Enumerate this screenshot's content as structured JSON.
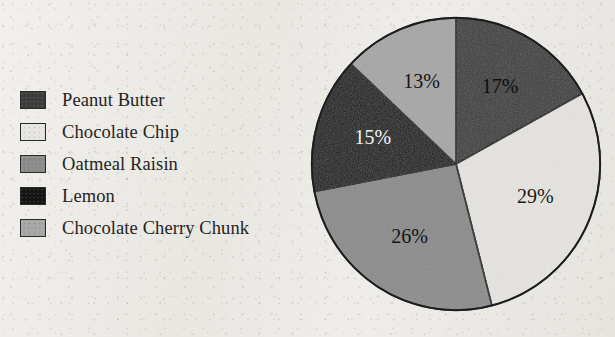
{
  "figure": {
    "type": "pie-chart",
    "background_color": "#eceae6"
  },
  "legend": {
    "items": [
      {
        "label": "Peanut Butter",
        "color": "#3c3c3c",
        "swatch_name": "legend-swatch-peanut-butter"
      },
      {
        "label": "Chocolate Chip",
        "color": "#e6e4e0",
        "swatch_name": "legend-swatch-chocolate-chip"
      },
      {
        "label": "Oatmeal Raisin",
        "color": "#8b8b8b",
        "swatch_name": "legend-swatch-oatmeal-raisin"
      },
      {
        "label": "Lemon",
        "color": "#151515",
        "swatch_name": "legend-swatch-lemon"
      },
      {
        "label": "Chocolate Cherry Chunk",
        "color": "#a6a6a6",
        "swatch_name": "legend-swatch-chocolate-cherry-chunk"
      }
    ]
  },
  "chart_data": {
    "type": "pie",
    "title": "",
    "categories": [
      "Peanut Butter",
      "Chocolate Chip",
      "Oatmeal Raisin",
      "Lemon",
      "Chocolate Cherry Chunk"
    ],
    "values": [
      17,
      29,
      26,
      15,
      13
    ],
    "labels": [
      "17%",
      "29%",
      "26%",
      "15%",
      "13%"
    ],
    "units": "percent",
    "total": 100,
    "start_angle_deg": 0,
    "direction": "clockwise",
    "legend_position": "left",
    "grid": false,
    "slice_colors": [
      "#3c3c3c",
      "#e6e4e0",
      "#8b8b8b",
      "#151515",
      "#a6a6a6"
    ],
    "label_text_colors": [
      "#0d0d0d",
      "#1a1a1a",
      "#141414",
      "#f2f2f2",
      "#141414"
    ],
    "outline_color": "#1d1d1d",
    "slices": [
      {
        "category": "Peanut Butter",
        "value": 17,
        "label": "17%",
        "color": "#3c3c3c",
        "label_color": "#0d0d0d"
      },
      {
        "category": "Chocolate Chip",
        "value": 29,
        "label": "29%",
        "color": "#e6e4e0",
        "label_color": "#1a1a1a"
      },
      {
        "category": "Oatmeal Raisin",
        "value": 26,
        "label": "26%",
        "color": "#8b8b8b",
        "label_color": "#141414"
      },
      {
        "category": "Lemon",
        "value": 15,
        "label": "15%",
        "color": "#151515",
        "label_color": "#f2f2f2"
      },
      {
        "category": "Chocolate Cherry Chunk",
        "value": 13,
        "label": "13%",
        "color": "#a6a6a6",
        "label_color": "#141414"
      }
    ]
  }
}
